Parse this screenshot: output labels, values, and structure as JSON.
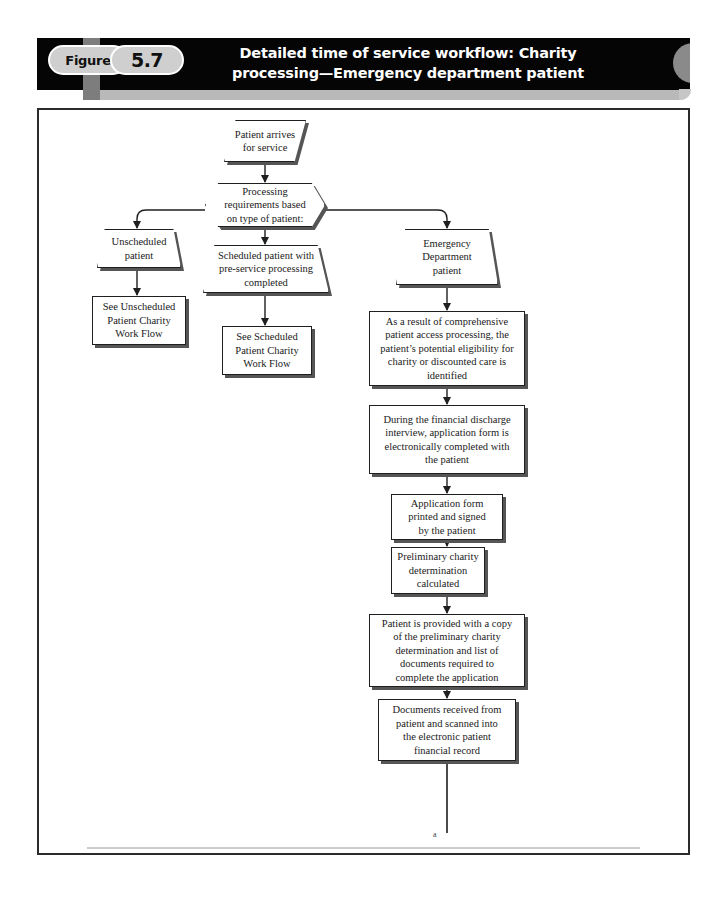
{
  "header": {
    "figure_label": "Figure",
    "figure_number": "5.7",
    "title_line1": "Detailed time of service workflow: Charity",
    "title_line2": "processing—Emergency department patient",
    "banner_color": "#050505",
    "pill_color": "#cfcfcf",
    "accent_gray": "#7d7d7d"
  },
  "flowchart": {
    "type": "flowchart",
    "orientation": "top-down",
    "nodes": [
      {
        "id": "start",
        "shape": "parallelogram",
        "text": "Patient arrives\nfor service"
      },
      {
        "id": "decision",
        "shape": "hexagon",
        "text": "Processing\nrequirements based\non type of patient:"
      },
      {
        "id": "unscheduled",
        "shape": "trapezoid",
        "text": "Unscheduled\npatient"
      },
      {
        "id": "scheduled",
        "shape": "trapezoid",
        "text": "Scheduled patient with\npre-service processing\ncompleted"
      },
      {
        "id": "emergency",
        "shape": "trapezoid",
        "text": "Emergency\nDepartment\npatient"
      },
      {
        "id": "see_unsched",
        "shape": "rectangle",
        "text": "See Unscheduled\nPatient Charity\nWork Flow"
      },
      {
        "id": "see_sched",
        "shape": "rectangle",
        "text": "See Scheduled\nPatient Charity\nWork Flow"
      },
      {
        "id": "step1",
        "shape": "rectangle",
        "text": "As a result of  comprehensive\npatient access processing, the\npatient’s potential eligibility for\ncharity or discounted care is\nidentified"
      },
      {
        "id": "step2",
        "shape": "rectangle",
        "text": "During the financial discharge\ninterview, application form is\nelectronically completed with\nthe patient"
      },
      {
        "id": "step3",
        "shape": "rectangle",
        "text": "Application form\nprinted and signed\nby the patient"
      },
      {
        "id": "step4",
        "shape": "rectangle",
        "text": "Preliminary charity\ndetermination\ncalculated"
      },
      {
        "id": "step5",
        "shape": "rectangle",
        "text": "Patient is provided with a copy\nof the preliminary charity\ndetermination and list of\ndocuments required to\ncomplete the application"
      },
      {
        "id": "step6",
        "shape": "rectangle",
        "text": "Documents received from\npatient and scanned into\nthe electronic patient\nfinancial record"
      }
    ],
    "edges": [
      {
        "from": "start",
        "to": "decision"
      },
      {
        "from": "decision",
        "to": "unscheduled"
      },
      {
        "from": "decision",
        "to": "scheduled"
      },
      {
        "from": "decision",
        "to": "emergency"
      },
      {
        "from": "unscheduled",
        "to": "see_unsched"
      },
      {
        "from": "scheduled",
        "to": "see_sched"
      },
      {
        "from": "emergency",
        "to": "step1"
      },
      {
        "from": "step1",
        "to": "step2"
      },
      {
        "from": "step2",
        "to": "step3"
      },
      {
        "from": "step3",
        "to": "step4"
      },
      {
        "from": "step4",
        "to": "step5"
      },
      {
        "from": "step5",
        "to": "step6"
      },
      {
        "from": "step6",
        "to": "offpage_a"
      }
    ],
    "connector_label": "a"
  }
}
